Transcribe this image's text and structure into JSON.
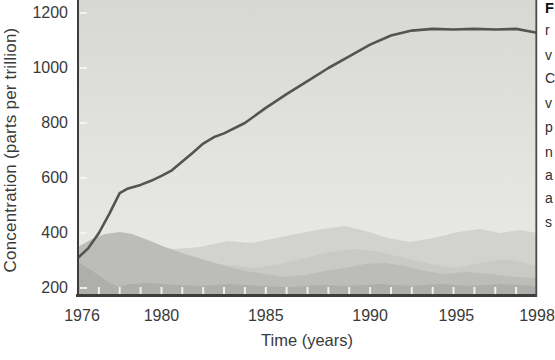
{
  "page": {
    "width_px": 554,
    "height_px": 360,
    "background_color": "#ffffff"
  },
  "chart_data": {
    "type": "line",
    "title": "",
    "xlabel": "Time (years)",
    "ylabel": "Concentration (parts per trillion)",
    "x_tick_labels": [
      "1976",
      "1980",
      "1985",
      "1990",
      "1995",
      "1998"
    ],
    "x_tick_values": [
      1976,
      1980,
      1985,
      1990,
      1995,
      1998
    ],
    "y_tick_labels": [
      "200",
      "400",
      "600",
      "800",
      "1000",
      "1200"
    ],
    "y_tick_values": [
      200,
      400,
      600,
      800,
      1000,
      1200
    ],
    "xlim": [
      1976,
      1998
    ],
    "ylim_visible": [
      170,
      1250
    ],
    "minor_x_tick_interval_years": 1,
    "grid": "off",
    "legend": "none",
    "series": [
      {
        "name": "concentration",
        "color": "#545454",
        "x": [
          1976,
          1976.5,
          1977,
          1977.5,
          1978,
          1978.4,
          1979,
          1979.5,
          1980,
          1980.5,
          1981,
          1981.5,
          1982,
          1982.5,
          1983,
          1984,
          1985,
          1986,
          1987,
          1988,
          1989,
          1990,
          1991,
          1992,
          1993,
          1994,
          1995,
          1996,
          1997,
          1998
        ],
        "values": [
          310,
          345,
          400,
          470,
          545,
          562,
          575,
          590,
          608,
          628,
          660,
          692,
          725,
          748,
          762,
          800,
          855,
          905,
          952,
          1000,
          1042,
          1085,
          1118,
          1136,
          1142,
          1140,
          1142,
          1140,
          1142,
          1128
        ]
      }
    ],
    "background_image_description": "grayscale photograph of hazy layered mountain ridges behind the plot"
  },
  "caption_column": {
    "note": "caption text cut off at right edge of screenshot; only first letters of each line visible",
    "first_line_bold": true,
    "fragments": [
      "F",
      "r",
      "v",
      "C",
      "v",
      "p",
      "n",
      "a",
      "a",
      "s"
    ]
  },
  "colors": {
    "axis": "#3d3d3d",
    "right_border": "#4a4a4a",
    "tick_marks": "#f5f5f2",
    "label_text": "#3a3a3a",
    "sky_top": "#d7d7d4",
    "sky_mid": "#e3e3e0",
    "sky_bottom": "#eaeae7",
    "ridge_far": "#d2d2cf",
    "ridge_mid": "#c9c9c6",
    "hill_front": "#bcbcb9",
    "hill_bottom": "#aeaeab"
  }
}
